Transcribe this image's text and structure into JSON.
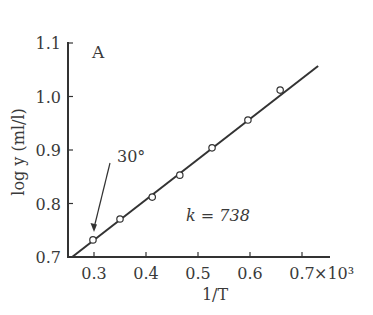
{
  "chart_data": {
    "type": "scatter",
    "title": "",
    "panel_label": "A",
    "xlabel": "1/T",
    "ylabel": "log y (ml/l)",
    "x_multiplier": "×10³",
    "xlim": [
      0.25,
      0.75
    ],
    "ylim": [
      0.7,
      1.1
    ],
    "xticks": [
      "0.3",
      "0.4",
      "0.5",
      "0.6",
      "0.7"
    ],
    "yticks": [
      "0.7",
      "0.8",
      "0.9",
      "1.0",
      "1.1"
    ],
    "grid": false,
    "legend": null,
    "series": [
      {
        "name": "observed",
        "marker": "open-circle",
        "x": [
          0.298,
          0.35,
          0.412,
          0.465,
          0.527,
          0.596,
          0.658
        ],
        "y": [
          0.732,
          0.771,
          0.812,
          0.853,
          0.904,
          0.956,
          1.012
        ]
      },
      {
        "name": "fit",
        "style": "line",
        "x": [
          0.258,
          0.731
        ],
        "y": [
          0.7,
          1.057
        ]
      }
    ],
    "annotations": [
      {
        "text": "30°",
        "arrow_to": {
          "x": 0.3,
          "y": 0.73
        }
      },
      {
        "text": "k = 738"
      }
    ]
  }
}
